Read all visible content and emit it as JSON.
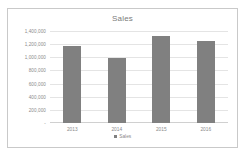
{
  "chart_data": {
    "type": "bar",
    "title": "Sales",
    "xlabel": "",
    "ylabel": "",
    "categories": [
      "2013",
      "2014",
      "2015",
      "2016"
    ],
    "values": [
      1170000,
      990000,
      1320000,
      1250000
    ],
    "series": [
      {
        "name": "Sales",
        "values": [
          1170000,
          990000,
          1320000,
          1250000
        ]
      }
    ],
    "ylim": [
      0,
      1400000
    ],
    "ytick_labels": [
      "1,400,000",
      "1,200,000",
      "1,000,000",
      "800,000",
      "600,000",
      "400,000",
      "200,000",
      "-"
    ],
    "ytick_values": [
      1400000,
      1200000,
      1000000,
      800000,
      600000,
      400000,
      200000,
      0
    ],
    "grid": true,
    "legend": {
      "position": "bottom",
      "entries": [
        "Sales"
      ]
    },
    "colors": {
      "bar": "#808080",
      "gridline": "#e4e4e4",
      "axis": "#d0d0d0",
      "text": "#8a8a8a",
      "border": "#c9c9c9",
      "background": "#ffffff"
    }
  },
  "legend": {
    "swatch_icon": "legend-square-icon",
    "label": "Sales"
  }
}
